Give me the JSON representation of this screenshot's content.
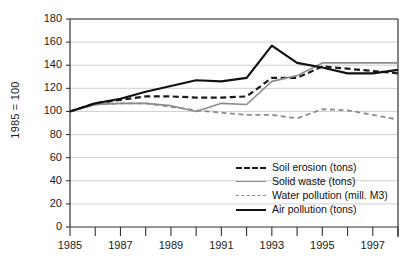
{
  "chart_data": {
    "type": "line",
    "title": "",
    "xlabel": "",
    "ylabel": "1985 = 100",
    "x": [
      1985,
      1986,
      1987,
      1988,
      1989,
      1990,
      1991,
      1992,
      1993,
      1994,
      1995,
      1996,
      1997,
      1998
    ],
    "xlim": [
      1985,
      1998
    ],
    "ylim": [
      0,
      180
    ],
    "ytick_values": [
      0,
      20,
      40,
      60,
      80,
      100,
      120,
      140,
      160,
      180
    ],
    "ytick_labels": [
      "0",
      "20",
      "40",
      "60",
      "80",
      "100",
      "120",
      "140",
      "160",
      "180"
    ],
    "xtick_values": [
      1985,
      1986,
      1987,
      1988,
      1989,
      1990,
      1991,
      1992,
      1993,
      1994,
      1995,
      1996,
      1997,
      1998
    ],
    "xtick_labels": [
      "1985",
      "",
      "1987",
      "",
      "1989",
      "",
      "1991",
      "",
      "1993",
      "",
      "1995",
      "",
      "1997",
      ""
    ],
    "grid": "horizontal",
    "legend_position": "inside-lower-right",
    "series": [
      {
        "name": "Soil erosion (tons)",
        "style": "dashed",
        "color": "#1a1a1a",
        "width": 2.2,
        "values": [
          100,
          107,
          110,
          113,
          113,
          112,
          112,
          113,
          129,
          129,
          139,
          137,
          135,
          133
        ]
      },
      {
        "name": "Solid waste (tons)",
        "style": "solid",
        "color": "#8c8c8c",
        "width": 1.6,
        "values": [
          100,
          106,
          107,
          107,
          105,
          100,
          107,
          106,
          126,
          131,
          142,
          142,
          142,
          142
        ]
      },
      {
        "name": "Water pollution (mill. M3)",
        "style": "dashed",
        "color": "#8c8c8c",
        "width": 1.8,
        "values": [
          100,
          106,
          107,
          107,
          104,
          101,
          99,
          97,
          97,
          94,
          102,
          101,
          97,
          93
        ]
      },
      {
        "name": "Air pollution (tons)",
        "style": "solid",
        "color": "#111111",
        "width": 2.2,
        "values": [
          100,
          107,
          111,
          117,
          122,
          127,
          126,
          129,
          157,
          142,
          138,
          133,
          133,
          136
        ]
      }
    ]
  },
  "legend": {
    "items": [
      {
        "label": "Soil erosion (tons)"
      },
      {
        "label": "Solid waste (tons)"
      },
      {
        "label": "Water pollution (mill. M3)"
      },
      {
        "label": "Air pollution (tons)"
      }
    ]
  },
  "colors": {
    "gridline": "#c9c9c9",
    "axis": "#333333",
    "plot_background": "#ffffff",
    "page_background": "#ffffff",
    "dark_series": "#111111",
    "gray_series": "#8c8c8c"
  }
}
